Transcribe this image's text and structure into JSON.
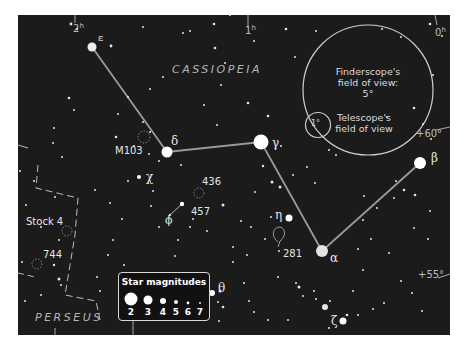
{
  "chart": {
    "constellation": "CASSIOPEIA",
    "neighbor_constellation": "PERSEUS",
    "ra_labels": [
      {
        "label": "2",
        "sup": "h"
      },
      {
        "label": "1",
        "sup": "h"
      },
      {
        "label": "0",
        "sup": "h"
      }
    ],
    "dec_labels": [
      "+60°",
      "+55°"
    ],
    "stars": [
      {
        "name": "epsilon",
        "symbol": "ε"
      },
      {
        "name": "delta",
        "symbol": "δ"
      },
      {
        "name": "gamma",
        "symbol": "γ"
      },
      {
        "name": "alpha",
        "symbol": "α"
      },
      {
        "name": "beta",
        "symbol": "β"
      },
      {
        "name": "chi",
        "symbol": "χ"
      },
      {
        "name": "phi",
        "symbol": "ϕ"
      },
      {
        "name": "eta",
        "symbol": "η"
      },
      {
        "name": "theta",
        "symbol": "θ"
      },
      {
        "name": "zeta",
        "symbol": "ζ"
      }
    ],
    "deep_sky": {
      "m103": "M103",
      "ngc436": "436",
      "ngc457": "457",
      "ngc281": "281",
      "stock4": "Stock 4",
      "ngc744": "744"
    },
    "finderscope": {
      "line1": "Finderscope's",
      "line2": "field of view:",
      "line3": "5°"
    },
    "telescope": {
      "circle_label": "1°",
      "line1": "Telescope's",
      "line2": "field of view"
    },
    "legend": {
      "title": "Star magnitudes",
      "magnitudes": [
        "2",
        "3",
        "4",
        "5",
        "6",
        "7"
      ]
    },
    "colors": {
      "background": "#1b1b1b",
      "lines": "#9a9a9a",
      "stars": "#f2f2f2",
      "text": "#e6e6e6"
    }
  }
}
